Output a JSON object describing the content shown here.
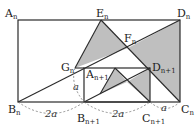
{
  "diagram": {
    "type": "geometry",
    "colors": {
      "stroke": "#2a2a2a",
      "fill": "#bfbfbf",
      "dashed": "#777777"
    },
    "points": {
      "An": {
        "label": "A",
        "sub": "n",
        "x": 18,
        "y": 20
      },
      "Dn": {
        "label": "D",
        "sub": "n",
        "x": 180,
        "y": 20
      },
      "Bn": {
        "label": "B",
        "sub": "n",
        "x": 18,
        "y": 102
      },
      "Cn": {
        "label": "C",
        "sub": "n",
        "x": 180,
        "y": 102
      },
      "En": {
        "label": "E",
        "sub": "n",
        "x": 101,
        "y": 20
      },
      "Fn": {
        "label": "F",
        "sub": "n",
        "x": 128,
        "y": 48
      },
      "Gn": {
        "label": "G",
        "sub": "n",
        "x": 75,
        "y": 68
      },
      "An1": {
        "label": "A",
        "sub": "n+1",
        "x": 84,
        "y": 68
      },
      "Dn1": {
        "label": "D",
        "sub": "n+1",
        "x": 150,
        "y": 68
      },
      "Bn1": {
        "label": "B",
        "sub": "n+1",
        "x": 84,
        "y": 102
      },
      "Cn1": {
        "label": "C",
        "sub": "n+1",
        "x": 150,
        "y": 102
      }
    },
    "dimensions": [
      {
        "text": "2a",
        "between": [
          "Bn",
          "Bn1"
        ]
      },
      {
        "text": "2a",
        "between": [
          "Bn1",
          "Cn1"
        ]
      },
      {
        "text": "a",
        "between": [
          "Cn1",
          "Cn"
        ]
      },
      {
        "text": "a",
        "between": [
          "Gn",
          "Bn1"
        ]
      }
    ],
    "labels": {
      "An": {
        "main": "A",
        "sub": "n"
      },
      "Dn": {
        "main": "D",
        "sub": "n"
      },
      "Bn": {
        "main": "B",
        "sub": "n"
      },
      "Cn": {
        "main": "C",
        "sub": "n"
      },
      "En": {
        "main": "E",
        "sub": "n"
      },
      "Fn": {
        "main": "F",
        "sub": "n"
      },
      "Gn": {
        "main": "G",
        "sub": "n"
      },
      "An1": {
        "main": "A",
        "sub": "n+1"
      },
      "Dn1": {
        "main": "D",
        "sub": "n+1"
      },
      "Bn1": {
        "main": "B",
        "sub": "n+1"
      },
      "Cn1": {
        "main": "C",
        "sub": "n+1"
      },
      "dim_BnBn1": "2a",
      "dim_Bn1Cn1": "2a",
      "dim_Cn1Cn": "a",
      "dim_GnBn1": "a"
    }
  }
}
